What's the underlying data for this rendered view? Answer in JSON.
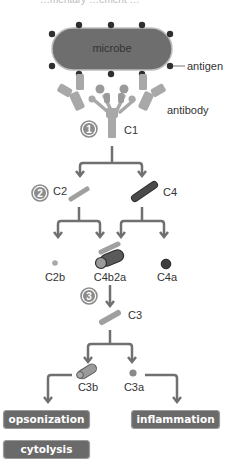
{
  "header": {
    "cropped_caption": "…mentary …ement …"
  },
  "colors": {
    "microbe_fill": "#6e6e6e",
    "antigen_dot": "#2f2f2f",
    "antibody": "#a8a8a8",
    "arrow": "#707070",
    "c2": "#a0a0a0",
    "c4": "#4a4a4a",
    "box_fill": "#6a6a6a",
    "box_border": "#9a9a9a",
    "step_badge": "#8c8c8c"
  },
  "labels": {
    "microbe": "microbe",
    "antigen": "antigen",
    "antibody": "antibody",
    "c1": "C1",
    "c2": "C2",
    "c4": "C4",
    "c2b": "C2b",
    "c4b2a": "C4b2a",
    "c4a": "C4a",
    "c3": "C3",
    "c3b": "C3b",
    "c3a": "C3a"
  },
  "steps": [
    "1",
    "2",
    "3"
  ],
  "outcomes": {
    "opsonization": "opsonization",
    "cytolysis": "cytolysis",
    "inflammation": "inflammation"
  }
}
